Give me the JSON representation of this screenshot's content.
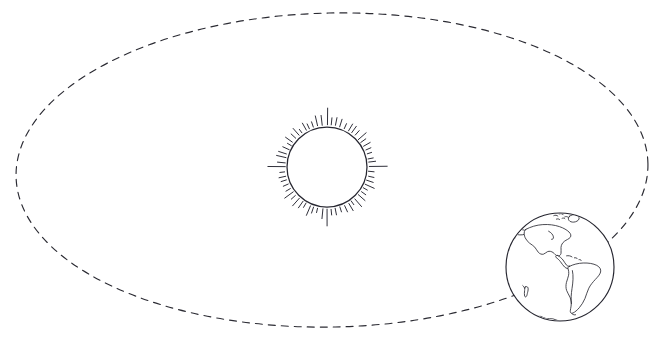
{
  "diagram": {
    "type": "astronomical-diagram",
    "style": "hand-drawn line art",
    "background_color": "#ffffff",
    "ink_color": "#2a2a33",
    "canvas": {
      "width": 663,
      "height": 357
    }
  },
  "orbit": {
    "label": "Earth's orbital path",
    "shape": "ellipse",
    "line_style": "dashed",
    "center_x": 332,
    "center_y": 170,
    "radius_x": 316,
    "radius_y": 157,
    "dash_pattern": "7 6",
    "stroke_color": "#2b2b33"
  },
  "sun": {
    "label": "Sun",
    "center_x": 327,
    "center_y": 167,
    "radius": 40,
    "ray_count": 60,
    "ray_min_length": 4,
    "ray_max_length": 16,
    "stroke_color": "#262630",
    "fill_color": "#ffffff"
  },
  "earth": {
    "label": "Earth",
    "center_x": 560,
    "center_y": 267,
    "radius": 54,
    "stroke_color": "#262630",
    "fill_color": "#ffffff",
    "visible_hemisphere": "Western Hemisphere",
    "landmasses": [
      "North America",
      "South America",
      "Greenland",
      "Arctic islands",
      "Central America",
      "Caribbean islands",
      "Antarctica",
      "Pacific island"
    ]
  }
}
